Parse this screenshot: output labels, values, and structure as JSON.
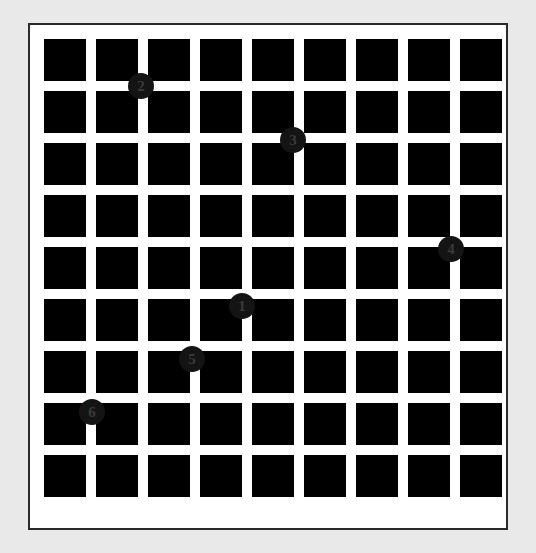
{
  "scene": {
    "title": "Hermann grid with numbered intersection markers",
    "background_color": "#e9e9e9",
    "panel": {
      "background_color": "#ffffff",
      "border_color": "#2a2a2a",
      "x": 28,
      "y": 23,
      "width": 480,
      "height": 507
    }
  },
  "grid": {
    "rows": 9,
    "cols": 9,
    "square_color": "#000000",
    "gap_color": "#ffffff",
    "square_size": 42,
    "gap": 10,
    "origin_x": 14,
    "origin_y": 14
  },
  "markers": [
    {
      "label": "1",
      "x": 240,
      "y": 304,
      "color": "#141414",
      "text_color": "#3a3a3a"
    },
    {
      "label": "2",
      "x": 139,
      "y": 84,
      "color": "#141414",
      "text_color": "#3a3a3a"
    },
    {
      "label": "3",
      "x": 291,
      "y": 138,
      "color": "#141414",
      "text_color": "#3a3a3a"
    },
    {
      "label": "4",
      "x": 449,
      "y": 247,
      "color": "#141414",
      "text_color": "#3a3a3a"
    },
    {
      "label": "5",
      "x": 190,
      "y": 357,
      "color": "#141414",
      "text_color": "#3a3a3a"
    },
    {
      "label": "6",
      "x": 90,
      "y": 410,
      "color": "#141414",
      "text_color": "#3a3a3a"
    }
  ]
}
